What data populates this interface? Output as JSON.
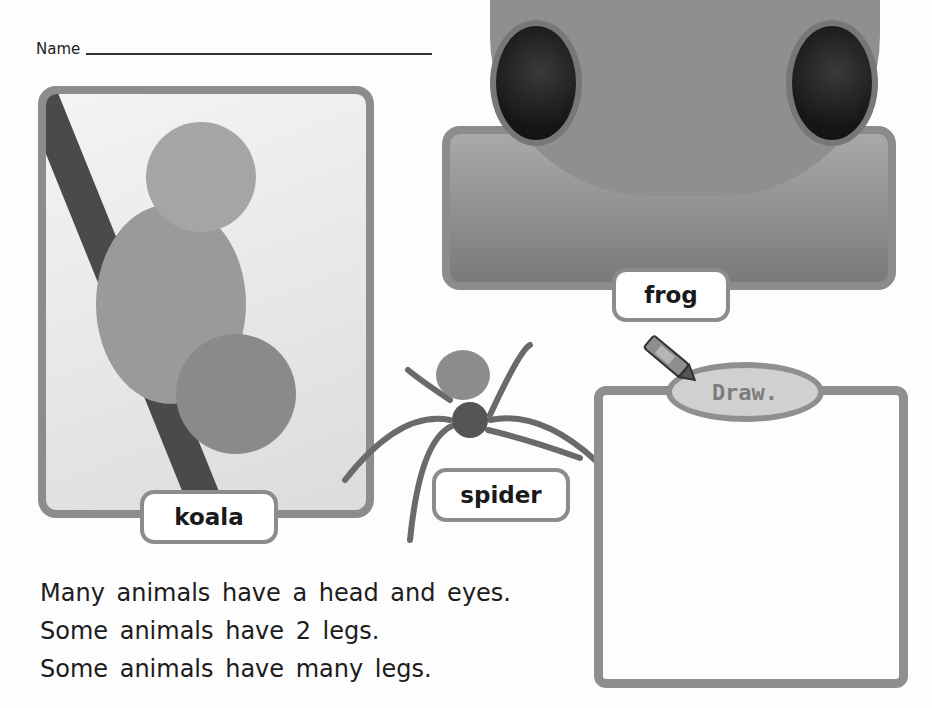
{
  "header": {
    "name_label": "Name"
  },
  "cards": {
    "koala": {
      "label": "koala"
    },
    "frog": {
      "label": "frog"
    },
    "spider": {
      "label": "spider"
    }
  },
  "draw": {
    "label": "Draw."
  },
  "sentences": [
    "Many animals have a head and eyes.",
    "Some animals have 2 legs.",
    "Some animals have many legs."
  ],
  "colors": {
    "frame": "#8c8c8c",
    "draw_bubble": "#d0d0d0"
  }
}
